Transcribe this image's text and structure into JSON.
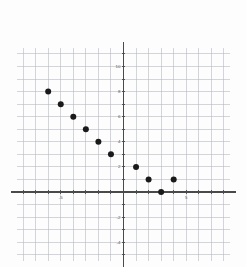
{
  "figure": {
    "kind": "cartesian-scatter-plot",
    "background_color": "#fdfdfd",
    "grid_color": "#b9b9c4",
    "minor_grid_color": "#e2e2e8",
    "axis_color": "#4a4a4a",
    "point_color": "#1a1a1a",
    "label_color": "#555555"
  },
  "chart_data": {
    "type": "scatter",
    "title": "",
    "xlabel": "",
    "ylabel": "",
    "xlim": [
      -8.5,
      8.5
    ],
    "ylim": [
      -5.5,
      11.5
    ],
    "grid": true,
    "legend": null,
    "x_tick_labels": [
      "-5",
      "5"
    ],
    "x_tick_values": [
      -5,
      5
    ],
    "y_tick_labels": [
      "10",
      "8",
      "6",
      "4",
      "2",
      "-2",
      "-4"
    ],
    "y_tick_values": [
      10,
      8,
      6,
      4,
      2,
      -2,
      -4
    ],
    "x": [
      -6,
      -5,
      -4,
      -3,
      -2,
      -1,
      1,
      2,
      4
    ],
    "y": [
      8,
      7,
      6,
      5,
      4,
      3,
      2,
      1,
      1
    ],
    "points": [
      {
        "x": -6,
        "y": 8
      },
      {
        "x": -5,
        "y": 7
      },
      {
        "x": -4,
        "y": 6
      },
      {
        "x": -3,
        "y": 5
      },
      {
        "x": -2,
        "y": 4
      },
      {
        "x": -1,
        "y": 3
      },
      {
        "x": 1,
        "y": 2
      },
      {
        "x": 2,
        "y": 1
      },
      {
        "x": 3,
        "y": 0
      },
      {
        "x": 4,
        "y": 1
      }
    ]
  },
  "axes": {
    "x_axis_name": "x-axis",
    "y_axis_name": "y-axis",
    "origin_label": ""
  }
}
